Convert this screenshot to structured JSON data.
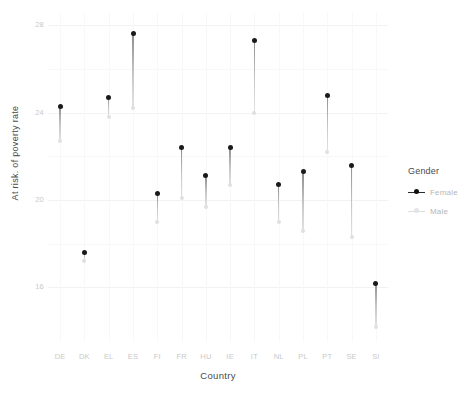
{
  "chart_data": {
    "type": "scatter",
    "title": "",
    "xlabel": "Country",
    "ylabel": "At risk. of poverty rate",
    "ylim": [
      13.5,
      28.6
    ],
    "yticks": [
      16,
      20,
      24,
      28
    ],
    "ytick_labels": [
      "16",
      "20",
      "24",
      "28"
    ],
    "grid": true,
    "legend_position": "right",
    "legend_title": "Gender",
    "categories": [
      "DE",
      "DK",
      "EL",
      "ES",
      "FI",
      "FR",
      "HU",
      "IE",
      "IT",
      "NL",
      "PL",
      "PT",
      "SE",
      "SI"
    ],
    "series": [
      {
        "name": "Female",
        "color": "#1a1a1a",
        "values": [
          24.3,
          17.6,
          24.7,
          27.6,
          20.3,
          22.4,
          21.1,
          22.4,
          27.3,
          20.7,
          21.3,
          24.8,
          21.6,
          16.2
        ]
      },
      {
        "name": "Male",
        "color": "#e0e0e0",
        "values": [
          22.7,
          17.2,
          23.8,
          24.2,
          19.0,
          20.1,
          19.7,
          20.7,
          24.0,
          19.0,
          18.6,
          22.2,
          18.3,
          14.2
        ]
      }
    ]
  },
  "legend": {
    "title": "Gender",
    "entries": [
      {
        "label": "Female",
        "key": "female-marker-icon"
      },
      {
        "label": "Male",
        "key": "male-marker-icon"
      }
    ]
  },
  "axes": {
    "y_title": "At risk. of poverty rate",
    "x_title": "Country"
  }
}
